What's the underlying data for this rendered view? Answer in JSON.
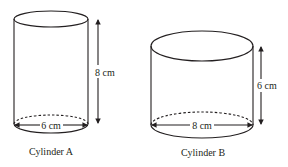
{
  "diagram": {
    "type": "geometry-cylinders",
    "stroke_color": "#231f20",
    "cylinders": [
      {
        "name": "Cylinder A",
        "caption": "Cylinder A",
        "height_label": "8 cm",
        "diameter_label": "6 cm",
        "height_value": 8,
        "diameter_value": 6,
        "unit": "cm"
      },
      {
        "name": "Cylinder B",
        "caption": "Cylinder B",
        "height_label": "6 cm",
        "diameter_label": "8 cm",
        "height_value": 6,
        "diameter_value": 8,
        "unit": "cm"
      }
    ]
  }
}
